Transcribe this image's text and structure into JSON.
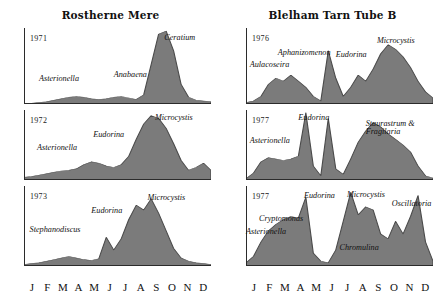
{
  "figure": {
    "columns": [
      {
        "id": "rostherne-mere",
        "title": "Rostherne Mere",
        "months": [
          "J",
          "F",
          "M",
          "A",
          "M",
          "J",
          "J",
          "A",
          "S",
          "O",
          "N",
          "D"
        ],
        "panels": [
          {
            "year": "1971",
            "labels": [
              {
                "name": "Asterionella",
                "x": 8,
                "y": 62
              },
              {
                "name": "Anabaena",
                "x": 48,
                "y": 56
              },
              {
                "name": "Ceratium",
                "x": 75,
                "y": 8
              }
            ]
          },
          {
            "year": "1972",
            "labels": [
              {
                "name": "Asterionella",
                "x": 7,
                "y": 48
              },
              {
                "name": "Eudorina",
                "x": 37,
                "y": 30
              },
              {
                "name": "Microcystis",
                "x": 70,
                "y": 6
              }
            ]
          },
          {
            "year": "1973",
            "labels": [
              {
                "name": "Stephanodiscus",
                "x": 3,
                "y": 50
              },
              {
                "name": "Eudorina",
                "x": 36,
                "y": 26
              },
              {
                "name": "Microcystis",
                "x": 66,
                "y": 10
              }
            ]
          }
        ]
      },
      {
        "id": "blelham-tarn-tube-b",
        "title": "Blelham Tarn Tube B",
        "months": [
          "J",
          "F",
          "M",
          "A",
          "M",
          "J",
          "J",
          "A",
          "S",
          "O",
          "N",
          "D"
        ],
        "panels": [
          {
            "year": "1976",
            "labels": [
              {
                "name": "Aulacoseira",
                "x": 2,
                "y": 44
              },
              {
                "name": "Aphanizomenon",
                "x": 17,
                "y": 28
              },
              {
                "name": "Eudorina",
                "x": 48,
                "y": 30
              },
              {
                "name": "Microcystis",
                "x": 70,
                "y": 12
              }
            ]
          },
          {
            "year": "1977",
            "labels": [
              {
                "name": "Asterionella",
                "x": 2,
                "y": 38
              },
              {
                "name": "Eudorina",
                "x": 28,
                "y": 6
              },
              {
                "name": "Staurastrum & Fragilaria",
                "x": 64,
                "y": 14
              }
            ]
          },
          {
            "year": "1977",
            "labels": [
              {
                "name": "Asterionella",
                "x": 0,
                "y": 52
              },
              {
                "name": "Cryptomonas",
                "x": 7,
                "y": 36
              },
              {
                "name": "Eudorina",
                "x": 31,
                "y": 8
              },
              {
                "name": "Microcystis",
                "x": 54,
                "y": 6
              },
              {
                "name": "Chromulina",
                "x": 50,
                "y": 72
              },
              {
                "name": "Oscillatoria",
                "x": 78,
                "y": 18
              }
            ]
          }
        ]
      }
    ]
  },
  "chart_data": [
    {
      "type": "area",
      "title": "Rostherne Mere",
      "subtitle": "1971",
      "xlabel": "",
      "ylabel": "",
      "categories": [
        "J",
        "F",
        "M",
        "A",
        "M",
        "J",
        "J",
        "A",
        "S",
        "O",
        "N",
        "D"
      ],
      "x": [
        0,
        4,
        8,
        12,
        16,
        20,
        24,
        28,
        32,
        36,
        40,
        44,
        48,
        52,
        56,
        60,
        64,
        68,
        72,
        76,
        80,
        84,
        88,
        92,
        96,
        100
      ],
      "values": [
        1,
        1,
        2,
        3,
        5,
        7,
        9,
        10,
        9,
        7,
        6,
        7,
        9,
        10,
        8,
        6,
        12,
        52,
        92,
        96,
        70,
        26,
        9,
        5,
        4,
        3
      ],
      "ylim": [
        0,
        100
      ],
      "grid": false,
      "annotations": [
        "Asterionella",
        "Anabaena",
        "Ceratium"
      ]
    },
    {
      "type": "area",
      "title": "Rostherne Mere",
      "subtitle": "1972",
      "categories": [
        "J",
        "F",
        "M",
        "A",
        "M",
        "J",
        "J",
        "A",
        "S",
        "O",
        "N",
        "D"
      ],
      "x": [
        0,
        4,
        8,
        12,
        16,
        20,
        24,
        28,
        32,
        36,
        40,
        44,
        48,
        52,
        56,
        60,
        64,
        68,
        72,
        76,
        80,
        84,
        88,
        92,
        96,
        100
      ],
      "values": [
        4,
        5,
        7,
        9,
        11,
        13,
        14,
        16,
        22,
        26,
        24,
        20,
        18,
        22,
        34,
        58,
        80,
        92,
        88,
        74,
        52,
        28,
        14,
        18,
        24,
        14
      ],
      "ylim": [
        0,
        100
      ],
      "grid": false,
      "annotations": [
        "Asterionella",
        "Eudorina",
        "Microcystis"
      ]
    },
    {
      "type": "area",
      "title": "Rostherne Mere",
      "subtitle": "1973",
      "categories": [
        "J",
        "F",
        "M",
        "A",
        "M",
        "J",
        "J",
        "A",
        "S",
        "O",
        "N",
        "D"
      ],
      "x": [
        0,
        4,
        8,
        12,
        16,
        20,
        24,
        28,
        32,
        36,
        40,
        44,
        48,
        52,
        56,
        60,
        64,
        68,
        72,
        76,
        80,
        84,
        88,
        92,
        96,
        100
      ],
      "values": [
        2,
        3,
        4,
        6,
        8,
        10,
        12,
        10,
        8,
        7,
        9,
        36,
        20,
        34,
        58,
        76,
        70,
        84,
        66,
        44,
        22,
        10,
        6,
        4,
        3,
        2
      ],
      "ylim": [
        0,
        100
      ],
      "grid": false,
      "annotations": [
        "Stephanodiscus",
        "Eudorina",
        "Microcystis"
      ]
    },
    {
      "type": "area",
      "title": "Blelham Tarn Tube B",
      "subtitle": "1976",
      "categories": [
        "J",
        "F",
        "M",
        "A",
        "M",
        "J",
        "J",
        "A",
        "S",
        "O",
        "N",
        "D"
      ],
      "x": [
        0,
        4,
        8,
        12,
        16,
        20,
        24,
        28,
        32,
        36,
        40,
        44,
        48,
        52,
        56,
        60,
        64,
        68,
        72,
        76,
        80,
        84,
        88,
        92,
        96,
        100
      ],
      "values": [
        2,
        4,
        10,
        26,
        34,
        30,
        38,
        30,
        22,
        10,
        4,
        70,
        34,
        10,
        22,
        38,
        30,
        46,
        66,
        78,
        72,
        62,
        48,
        30,
        16,
        8
      ],
      "ylim": [
        0,
        100
      ],
      "grid": false,
      "annotations": [
        "Aulacoseira",
        "Aphanizomenon",
        "Eudorina",
        "Microcystis"
      ]
    },
    {
      "type": "area",
      "title": "Blelham Tarn Tube B",
      "subtitle": "1977",
      "categories": [
        "J",
        "F",
        "M",
        "A",
        "M",
        "J",
        "J",
        "A",
        "S",
        "O",
        "N",
        "D"
      ],
      "x": [
        0,
        4,
        8,
        12,
        16,
        20,
        24,
        28,
        32,
        36,
        40,
        44,
        48,
        52,
        56,
        60,
        64,
        68,
        72,
        76,
        80,
        84,
        88,
        92,
        96,
        100
      ],
      "values": [
        2,
        10,
        26,
        32,
        30,
        28,
        30,
        34,
        96,
        20,
        6,
        88,
        16,
        8,
        30,
        54,
        70,
        82,
        76,
        66,
        58,
        50,
        40,
        20,
        6,
        3
      ],
      "ylim": [
        0,
        100
      ],
      "grid": false,
      "annotations": [
        "Asterionella",
        "Eudorina",
        "Staurastrum & Fragilaria"
      ]
    },
    {
      "type": "area",
      "title": "Blelham Tarn Tube B",
      "subtitle": "1977",
      "categories": [
        "J",
        "F",
        "M",
        "A",
        "M",
        "J",
        "J",
        "A",
        "S",
        "O",
        "N",
        "D"
      ],
      "x": [
        0,
        4,
        8,
        12,
        16,
        20,
        24,
        28,
        32,
        36,
        40,
        44,
        48,
        52,
        56,
        60,
        64,
        68,
        72,
        76,
        80,
        84,
        88,
        92,
        96,
        100
      ],
      "values": [
        4,
        12,
        30,
        44,
        52,
        58,
        62,
        60,
        86,
        16,
        6,
        4,
        20,
        56,
        92,
        64,
        74,
        70,
        40,
        34,
        56,
        40,
        62,
        88,
        30,
        6
      ],
      "ylim": [
        0,
        100
      ],
      "grid": false,
      "annotations": [
        "Asterionella",
        "Cryptomonas",
        "Eudorina",
        "Microcystis",
        "Chromulina",
        "Oscillatoria"
      ]
    }
  ],
  "style": {
    "fill": "#7b7b7b",
    "stroke": "#4a4a4a",
    "axis": "#2b2b2b",
    "text": "#111111"
  }
}
